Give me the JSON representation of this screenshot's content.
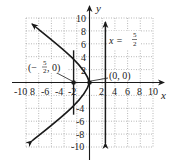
{
  "diagram": {
    "type": "coordinate-graph",
    "equation_family": "parabola opening left",
    "x_axis": {
      "label": "x",
      "min": -10,
      "max": 10,
      "step": 2,
      "tick_labels": [
        "-10",
        "8",
        "-6",
        "-4",
        "-2",
        "2",
        "4",
        "6",
        "8",
        "10"
      ]
    },
    "y_axis": {
      "label": "y",
      "min": -10,
      "max": 10,
      "step": 2,
      "tick_labels": [
        "10",
        "8",
        "6",
        "4",
        "2",
        "-4",
        "-6",
        "-8",
        "-10"
      ]
    },
    "grid": true,
    "points": [
      {
        "name": "focus",
        "x": -2.5,
        "y": 0,
        "label_main": "(−",
        "label_num": "5",
        "label_den": "2",
        "label_tail": ", 0)"
      },
      {
        "name": "vertex",
        "x": 0,
        "y": 0,
        "label": "(0, 0)"
      }
    ],
    "directrix": {
      "x": 2.5,
      "label_lhs": "x =",
      "label_num": "5",
      "label_den": "2"
    },
    "latus_rectum": {
      "x": -2.5,
      "y_from": -5,
      "y_to": 5
    },
    "colors": {
      "curve": "#1a1a1a",
      "grid": "#9a9a9a",
      "axis": "#1a1a1a"
    }
  }
}
